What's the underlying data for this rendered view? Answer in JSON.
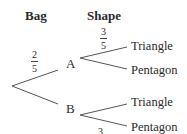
{
  "headers": {
    "bag": "Bag",
    "shape": "Shape"
  },
  "nodes": {
    "a": "A",
    "b": "B"
  },
  "leaves": {
    "a_top": "Triangle",
    "a_bottom": "Pentagon",
    "b_top": "Triangle",
    "b_bottom": "Pentagon"
  },
  "probabilities": {
    "root_to_a": {
      "numerator": "2",
      "denominator": "5"
    },
    "a_to_triangle": {
      "numerator": "3",
      "denominator": "5"
    },
    "b_to_pentagon_partial": {
      "numerator": "3"
    }
  },
  "colors": {
    "line": "#555555",
    "text": "#2a2a2a"
  }
}
